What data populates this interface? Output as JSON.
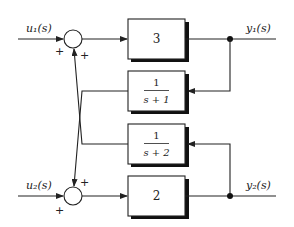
{
  "diagram": {
    "type": "mimo-block-diagram",
    "inputs": [
      {
        "id": "u1",
        "label": "u₁(s)"
      },
      {
        "id": "u2",
        "label": "u₂(s)"
      }
    ],
    "outputs": [
      {
        "id": "y1",
        "label": "y₁(s)"
      },
      {
        "id": "y2",
        "label": "y₂(s)"
      }
    ],
    "summers": [
      {
        "id": "sum1",
        "signs": {
          "input": "+",
          "feedback": "+"
        }
      },
      {
        "id": "sum2",
        "signs": {
          "input": "+",
          "feedback": "+"
        }
      }
    ],
    "blocks": [
      {
        "id": "forward1",
        "gain": "3"
      },
      {
        "id": "feedback1",
        "numerator": "1",
        "denominator": "s + 1"
      },
      {
        "id": "feedback2",
        "numerator": "1",
        "denominator": "s + 2"
      },
      {
        "id": "forward2",
        "gain": "2"
      }
    ],
    "connections": [
      "u1 -> sum1 (+)",
      "sum1 -> forward1 (3) -> y1",
      "y1 -> feedback1 (1/(s+1)) -> sum2 (+)",
      "u2 -> sum2 (+)",
      "sum2 -> forward2 (2) -> y2",
      "y2 -> feedback2 (1/(s+2)) -> sum1 (+)"
    ]
  }
}
